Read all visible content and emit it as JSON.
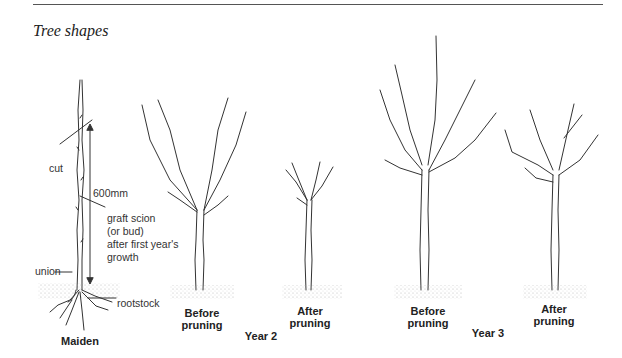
{
  "figure": {
    "title": "Tree shapes",
    "annotations": {
      "cut": "cut",
      "measure": "600mm",
      "graft_line1": "graft scion",
      "graft_line2": "(or bud)",
      "graft_line3": "after first year's",
      "graft_line4": "growth",
      "union": "union",
      "rootstock": "rootstock"
    },
    "stages": [
      {
        "caption": "Maiden"
      },
      {
        "caption_line1": "Before",
        "caption_line2": "pruning"
      },
      {
        "caption_line1": "After",
        "caption_line2": "pruning"
      },
      {
        "caption_line1": "Before",
        "caption_line2": "pruning"
      },
      {
        "caption_line1": "After",
        "caption_line2": "pruning"
      }
    ],
    "groups": [
      {
        "label": "Year 2"
      },
      {
        "label": "Year 3"
      }
    ]
  }
}
